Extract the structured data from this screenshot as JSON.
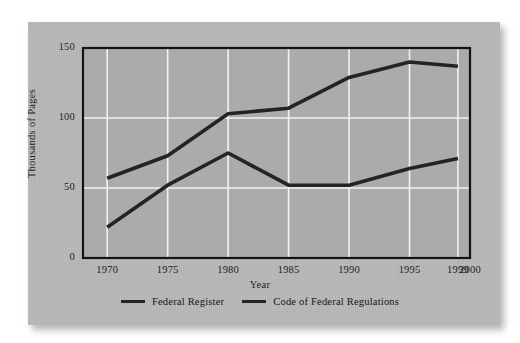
{
  "chart_data": {
    "type": "line",
    "title": "",
    "xlabel": "Year",
    "ylabel": "Thousands of Pages",
    "xlim": [
      1968,
      2000
    ],
    "ylim": [
      0,
      150
    ],
    "xticks": [
      "1970",
      "1975",
      "1980",
      "1985",
      "1990",
      "1995",
      "1999",
      "2000"
    ],
    "xtick_values": [
      1970,
      1975,
      1980,
      1985,
      1990,
      1995,
      1999,
      2000
    ],
    "yticks": [
      "0",
      "50",
      "100",
      "150"
    ],
    "ytick_values": [
      0,
      50,
      100,
      150
    ],
    "grid": true,
    "grid_color": "#f2f2f2",
    "legend_position": "bottom",
    "plot_background": "#ababab",
    "line_color": "#242424",
    "x": [
      1970,
      1975,
      1980,
      1985,
      1990,
      1995,
      1999
    ],
    "series": [
      {
        "name": "Federal Register",
        "values": [
          57,
          73,
          103,
          107,
          129,
          140,
          137
        ]
      },
      {
        "name": "Code of Federal Regulations",
        "values": [
          22,
          52,
          75,
          52,
          52,
          64,
          71
        ]
      }
    ]
  },
  "legend": {
    "items": [
      {
        "label": "Federal Register",
        "swatch": "line-swatch-icon"
      },
      {
        "label": "Code of Federal Regulations",
        "swatch": "line-swatch-icon"
      }
    ]
  },
  "axes": {
    "x_title": "Year",
    "y_title": "Thousands of Pages"
  }
}
